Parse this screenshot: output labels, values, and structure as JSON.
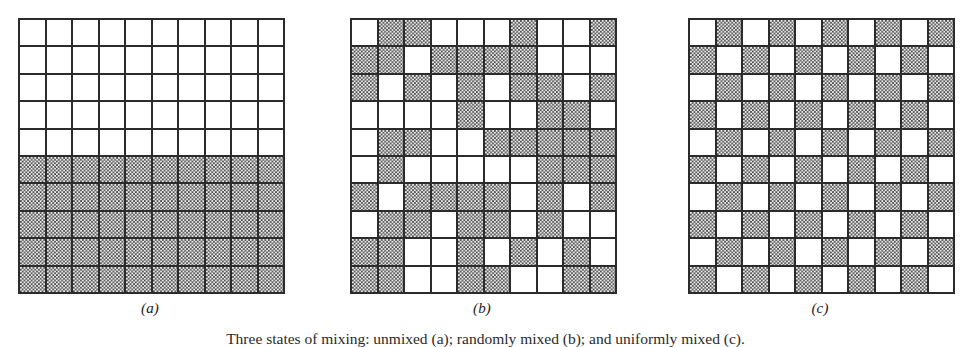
{
  "figure": {
    "caption": "Three states of mixing: unmixed (a); randomly mixed (b); and uniformly mixed (c).",
    "colors": {
      "grid_line": "#2b2b2b",
      "shaded_fill": "#9a9a9a",
      "empty_fill": "#ffffff",
      "text": "#222222"
    },
    "grid_size": {
      "rows": 10,
      "cols": 10
    },
    "panels": [
      {
        "id": "a",
        "label": "(a)",
        "name": "unmixed",
        "cells": [
          [
            0,
            0,
            0,
            0,
            0,
            0,
            0,
            0,
            0,
            0
          ],
          [
            0,
            0,
            0,
            0,
            0,
            0,
            0,
            0,
            0,
            0
          ],
          [
            0,
            0,
            0,
            0,
            0,
            0,
            0,
            0,
            0,
            0
          ],
          [
            0,
            0,
            0,
            0,
            0,
            0,
            0,
            0,
            0,
            0
          ],
          [
            0,
            0,
            0,
            0,
            0,
            0,
            0,
            0,
            0,
            0
          ],
          [
            1,
            1,
            1,
            1,
            1,
            1,
            1,
            1,
            1,
            1
          ],
          [
            1,
            1,
            1,
            1,
            1,
            1,
            1,
            1,
            1,
            1
          ],
          [
            1,
            1,
            1,
            1,
            1,
            1,
            1,
            1,
            1,
            1
          ],
          [
            1,
            1,
            1,
            1,
            1,
            1,
            1,
            1,
            1,
            1
          ],
          [
            1,
            1,
            1,
            1,
            1,
            1,
            1,
            1,
            1,
            1
          ]
        ]
      },
      {
        "id": "b",
        "label": "(b)",
        "name": "randomly-mixed",
        "cells": [
          [
            0,
            1,
            1,
            0,
            0,
            0,
            1,
            0,
            0,
            1
          ],
          [
            1,
            1,
            0,
            1,
            1,
            1,
            1,
            0,
            0,
            0
          ],
          [
            1,
            0,
            1,
            0,
            1,
            0,
            1,
            1,
            0,
            1
          ],
          [
            0,
            0,
            0,
            0,
            1,
            0,
            0,
            1,
            1,
            0
          ],
          [
            0,
            1,
            1,
            0,
            0,
            1,
            1,
            1,
            1,
            1
          ],
          [
            0,
            1,
            0,
            0,
            0,
            0,
            0,
            1,
            1,
            1
          ],
          [
            1,
            0,
            1,
            1,
            1,
            1,
            0,
            1,
            0,
            1
          ],
          [
            0,
            1,
            1,
            0,
            1,
            1,
            0,
            1,
            0,
            0
          ],
          [
            1,
            1,
            0,
            0,
            1,
            0,
            1,
            0,
            1,
            0
          ],
          [
            1,
            1,
            0,
            0,
            1,
            1,
            0,
            0,
            1,
            1
          ]
        ]
      },
      {
        "id": "c",
        "label": "(c)",
        "name": "uniformly-mixed",
        "cells": [
          [
            0,
            1,
            0,
            1,
            0,
            1,
            0,
            1,
            0,
            1
          ],
          [
            1,
            0,
            1,
            0,
            1,
            0,
            1,
            0,
            1,
            0
          ],
          [
            0,
            1,
            0,
            1,
            0,
            1,
            0,
            1,
            0,
            1
          ],
          [
            1,
            0,
            1,
            0,
            1,
            0,
            1,
            0,
            1,
            0
          ],
          [
            0,
            1,
            0,
            1,
            0,
            1,
            0,
            1,
            0,
            1
          ],
          [
            1,
            0,
            1,
            0,
            1,
            0,
            1,
            0,
            1,
            0
          ],
          [
            0,
            1,
            0,
            1,
            0,
            1,
            0,
            1,
            0,
            1
          ],
          [
            1,
            0,
            1,
            0,
            1,
            0,
            1,
            0,
            1,
            0
          ],
          [
            0,
            1,
            0,
            1,
            0,
            1,
            0,
            1,
            0,
            1
          ],
          [
            1,
            0,
            1,
            0,
            1,
            0,
            1,
            0,
            1,
            0
          ]
        ]
      }
    ]
  }
}
